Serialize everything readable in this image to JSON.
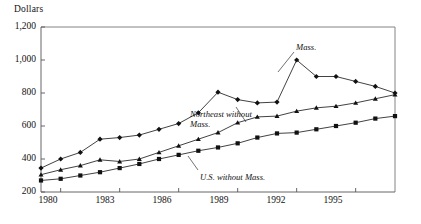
{
  "axis": {
    "y_title": "Dollars",
    "y_ticks": [
      "1,200",
      "1,000",
      "800",
      "600",
      "400",
      "200"
    ],
    "x_ticks": [
      "1980",
      "1983",
      "1986",
      "1989",
      "1992",
      "1995"
    ]
  },
  "labels": {
    "mass": "Mass.",
    "northeast_line1": "Northeast without",
    "northeast_line2": "Mass.",
    "us": "U.S. without Mass."
  },
  "colors": {
    "ink": "#111111",
    "axis": "#555555",
    "frame": "#777777"
  },
  "chart_data": {
    "type": "line",
    "title": "",
    "xlabel": "",
    "ylabel": "Dollars",
    "xlim": [
      1979,
      1997
    ],
    "ylim": [
      200,
      1200
    ],
    "grid": false,
    "legend": "annotations",
    "x": [
      1979,
      1980,
      1981,
      1982,
      1983,
      1984,
      1985,
      1986,
      1987,
      1988,
      1989,
      1990,
      1991,
      1992,
      1993,
      1994,
      1995,
      1996,
      1997
    ],
    "series": [
      {
        "name": "Mass.",
        "marker": "diamond",
        "values": [
          345,
          400,
          440,
          520,
          530,
          545,
          580,
          615,
          680,
          805,
          760,
          740,
          745,
          1000,
          900,
          900,
          870,
          840,
          800
        ]
      },
      {
        "name": "Northeast without Mass.",
        "marker": "triangle",
        "values": [
          305,
          335,
          360,
          395,
          385,
          400,
          440,
          480,
          520,
          560,
          620,
          655,
          660,
          690,
          710,
          720,
          740,
          765,
          790
        ]
      },
      {
        "name": "U.S. without Mass.",
        "marker": "square",
        "values": [
          270,
          280,
          300,
          320,
          345,
          370,
          400,
          425,
          450,
          470,
          495,
          530,
          555,
          560,
          580,
          600,
          620,
          645,
          660
        ]
      }
    ]
  }
}
